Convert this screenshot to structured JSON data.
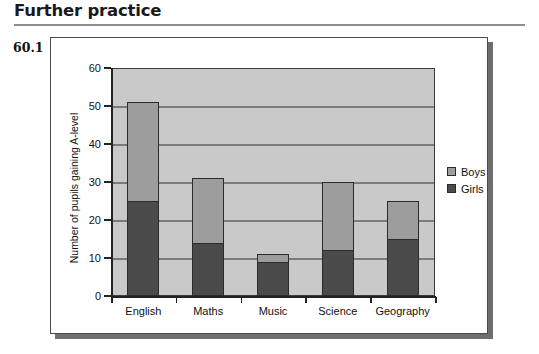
{
  "heading": {
    "title": "Further practice"
  },
  "question": {
    "number": "60.1"
  },
  "legend": {
    "position": "right",
    "items": [
      {
        "label": "Boys",
        "color": "#9d9d9d",
        "swatch_name": "legend-swatch-boys"
      },
      {
        "label": "Girls",
        "color": "#4b4b4b",
        "swatch_name": "legend-swatch-girls"
      }
    ]
  },
  "chart_data": {
    "type": "bar",
    "subtype": "stacked",
    "title": "",
    "xlabel": "",
    "ylabel": "Number of pupils gaining A-level",
    "categories": [
      "English",
      "Maths",
      "Music",
      "Science",
      "Geography"
    ],
    "series": [
      {
        "name": "Girls",
        "color": "#4b4b4b",
        "values": [
          25,
          14,
          9,
          12,
          15
        ]
      },
      {
        "name": "Boys",
        "color": "#9d9d9d",
        "values": [
          26,
          17,
          2,
          18,
          10
        ]
      }
    ],
    "totals": [
      51,
      31,
      11,
      30,
      25
    ],
    "ylim": [
      0,
      60
    ],
    "ytick_step": 10,
    "yticks": [
      0,
      10,
      20,
      30,
      40,
      50,
      60
    ],
    "ytick_labels": [
      "0",
      "10",
      "20",
      "30",
      "40",
      "50",
      "60"
    ],
    "grid": true,
    "grid_axis": "y",
    "plot_background": "#c9c9c9"
  }
}
